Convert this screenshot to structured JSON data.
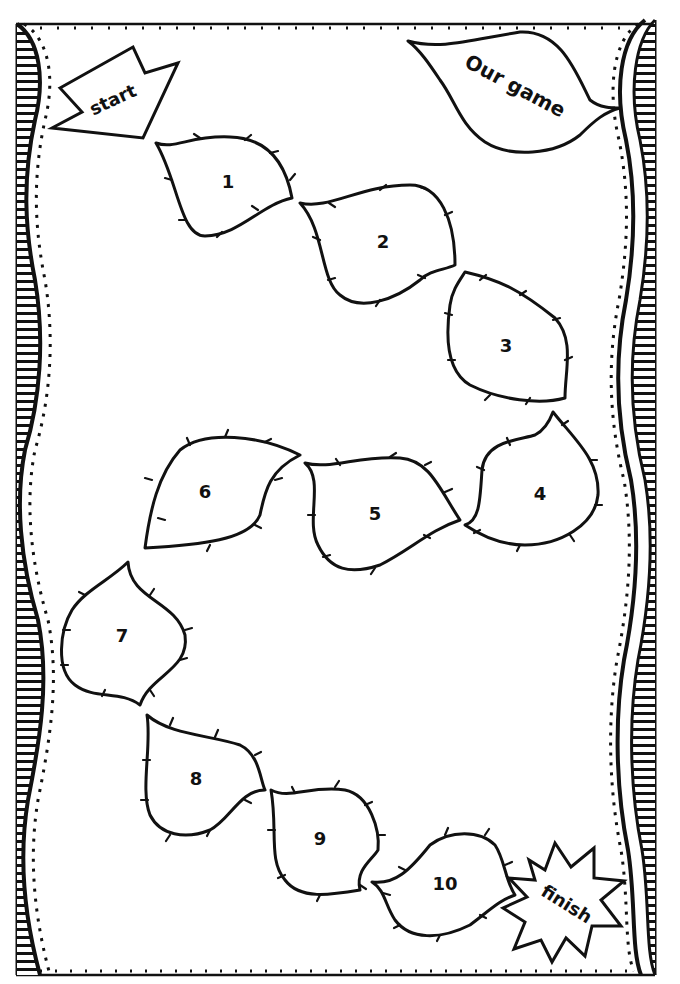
{
  "board": {
    "title": "Our game",
    "start_label": "start",
    "finish_label": "finish",
    "spaces": [
      {
        "number": "1"
      },
      {
        "number": "2"
      },
      {
        "number": "3"
      },
      {
        "number": "4"
      },
      {
        "number": "5"
      },
      {
        "number": "6"
      },
      {
        "number": "7"
      },
      {
        "number": "8"
      },
      {
        "number": "9"
      },
      {
        "number": "10"
      }
    ]
  },
  "colors": {
    "ink": "#111111",
    "paper": "#ffffff"
  }
}
